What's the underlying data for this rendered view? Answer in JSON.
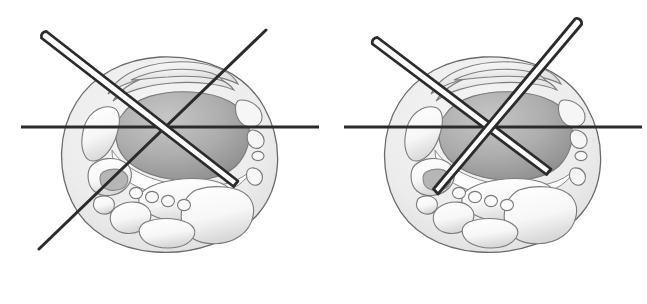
{
  "figure": {
    "title": "Axial ankle cross-section: wire / needle trajectory comparison",
    "background_color": "#ffffff",
    "width": 647,
    "height": 304,
    "panel_count": 2
  },
  "palette": {
    "background": "#ffffff",
    "outline_stroke": "#5a5a5a",
    "soft_tissue_fill": "#ebebeb",
    "soft_tissue_light": "#f4f4f4",
    "bone_fill": "#fafafa",
    "bone_shadow": "#d2d2d2",
    "talus_fill": "#a9a9a9",
    "talus_light": "#c4c4c4",
    "talus_dark": "#909090",
    "cartilage_fill": "#fdfdfd",
    "instrument_stroke": "#2b2b2b",
    "instrument_fill": "#ffffff",
    "reference_line": "#2b2b2b"
  },
  "panels": [
    {
      "id": "panel-left",
      "label": "A",
      "name": "left-panel",
      "anatomy": {
        "view": "axial ankle cross-section",
        "structures": [
          "soft tissue envelope",
          "talus body",
          "tibiotalar cartilage",
          "medial malleolus region",
          "tendon sheaths",
          "neurovascular bundle",
          "calcaneus",
          "small vessel cluster"
        ],
        "vessel_circle_count": 4
      },
      "instruments": [
        {
          "name": "hollow-needle",
          "type": "cannulated-needle",
          "style": "double-line-outline",
          "hub": [
            44,
            35
          ],
          "tip": [
            236,
            182
          ],
          "width_px": 7,
          "tip_shape": "bevel-point",
          "hub_shape": "rounded"
        },
        {
          "name": "guide-wire",
          "type": "k-wire",
          "style": "single-solid-line",
          "start": [
            266,
            30
          ],
          "end": [
            39,
            249
          ],
          "width_px": 3
        }
      ],
      "reference_line": {
        "name": "horizontal-reference-line",
        "orientation": "horizontal",
        "start": [
          21,
          127
        ],
        "end": [
          319,
          127
        ],
        "width_px": 3
      }
    },
    {
      "id": "panel-right",
      "label": "B",
      "name": "right-panel",
      "anatomy": {
        "view": "axial ankle cross-section",
        "structures": [
          "soft tissue envelope",
          "talus body",
          "tibiotalar cartilage",
          "medial malleolus region",
          "tendon sheaths",
          "neurovascular bundle",
          "calcaneus",
          "small vessel cluster"
        ],
        "vessel_circle_count": 4
      },
      "instruments": [
        {
          "name": "hollow-needle-lateral",
          "type": "cannulated-needle",
          "style": "double-line-outline",
          "hub": [
            52,
            41
          ],
          "tip": [
            226,
            170
          ],
          "width_px": 7,
          "tip_shape": "bevel-point",
          "hub_shape": "rounded"
        },
        {
          "name": "hollow-needle-medial",
          "type": "cannulated-needle",
          "style": "double-line-outline",
          "hub": [
            256,
            21
          ],
          "tip": [
            113,
            193
          ],
          "width_px": 7,
          "tip_shape": "bevel-point",
          "hub_shape": "rounded"
        }
      ],
      "reference_line": {
        "name": "horizontal-reference-line",
        "orientation": "horizontal",
        "start": [
          21,
          127
        ],
        "end": [
          319,
          127
        ],
        "width_px": 3
      }
    }
  ]
}
